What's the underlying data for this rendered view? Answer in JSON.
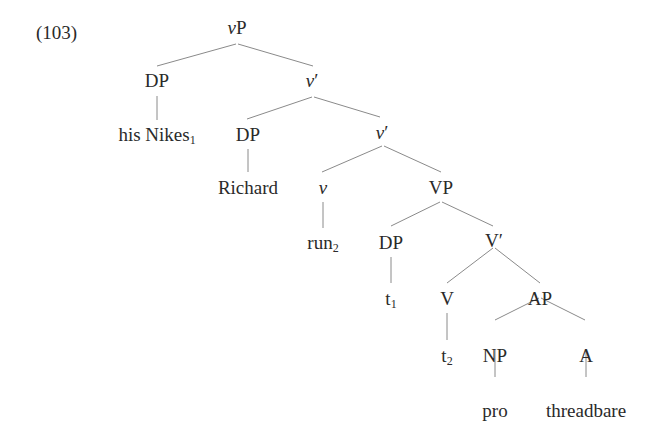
{
  "example": {
    "number": "(103)"
  },
  "tree": {
    "nodes": {
      "root": {
        "head": "v",
        "rest": "P"
      },
      "dp1": {
        "label": "DP"
      },
      "vbar1": {
        "head": "v",
        "rest": "′"
      },
      "his_nikes": {
        "text": "his Nikes",
        "sub": "1"
      },
      "dp2": {
        "label": "DP"
      },
      "vbar2": {
        "head": "v",
        "rest": "′"
      },
      "richard": {
        "text": "Richard"
      },
      "v_small": {
        "head": "v"
      },
      "vp": {
        "label": "VP"
      },
      "run": {
        "text": "run",
        "sub": "2"
      },
      "dp3": {
        "label": "DP"
      },
      "Vbar": {
        "label": "V′"
      },
      "t1": {
        "text": "t",
        "sub": "1"
      },
      "V": {
        "label": "V"
      },
      "ap": {
        "label": "AP"
      },
      "t2": {
        "text": "t",
        "sub": "2"
      },
      "np": {
        "label": "NP"
      },
      "a": {
        "label": "A"
      },
      "pro": {
        "text": "pro"
      },
      "threadbare": {
        "text": "threadbare"
      }
    },
    "edges": [
      [
        "root",
        "dp1"
      ],
      [
        "root",
        "vbar1"
      ],
      [
        "dp1",
        "his_nikes"
      ],
      [
        "vbar1",
        "dp2"
      ],
      [
        "vbar1",
        "vbar2"
      ],
      [
        "dp2",
        "richard"
      ],
      [
        "vbar2",
        "v_small"
      ],
      [
        "vbar2",
        "vp"
      ],
      [
        "v_small",
        "run"
      ],
      [
        "vp",
        "dp3"
      ],
      [
        "vp",
        "Vbar"
      ],
      [
        "dp3",
        "t1"
      ],
      [
        "Vbar",
        "V"
      ],
      [
        "Vbar",
        "ap"
      ],
      [
        "V",
        "t2"
      ],
      [
        "ap",
        "np"
      ],
      [
        "ap",
        "a"
      ],
      [
        "np",
        "pro"
      ],
      [
        "a",
        "threadbare"
      ]
    ]
  },
  "colors": {
    "text": "#2a2a2a",
    "branch": "#8a8a8a",
    "background": "#ffffff"
  }
}
